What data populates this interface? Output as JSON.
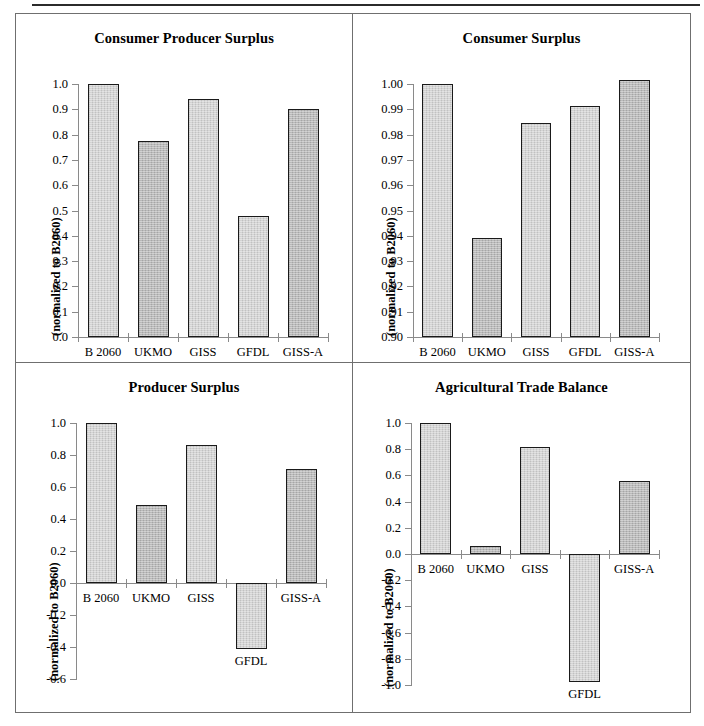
{
  "figure": {
    "panel_count": 4,
    "categories": [
      "B 2060",
      "UKMO",
      "GISS",
      "GFDL",
      "GISS-A"
    ],
    "ylabel": "(normalized to B2060)"
  },
  "chart_data": [
    {
      "type": "bar",
      "title": "Consumer Producer Surplus",
      "categories": [
        "B 2060",
        "UKMO",
        "GISS",
        "GFDL",
        "GISS-A"
      ],
      "values": [
        1.0,
        0.775,
        0.94,
        0.48,
        0.9
      ],
      "xlabel": "",
      "ylabel": "(normalized to B2060)",
      "ylim": [
        0.0,
        1.0
      ],
      "ytick_labels": [
        "1.0",
        "0.9",
        "0.8",
        "0.7",
        "0.6",
        "0.5",
        "0.4",
        "0.3",
        "0.2",
        "0.1",
        "0.0"
      ],
      "ytick_values": [
        1.0,
        0.9,
        0.8,
        0.7,
        0.6,
        0.5,
        0.4,
        0.3,
        0.2,
        0.1,
        0.0
      ],
      "grid": false,
      "legend": "none"
    },
    {
      "type": "bar",
      "title": "Consumer Surplus",
      "categories": [
        "B 2060",
        "UKMO",
        "GISS",
        "GFDL",
        "GISS-A"
      ],
      "values": [
        1.0,
        0.939,
        0.9845,
        0.9912,
        1.0015
      ],
      "xlabel": "",
      "ylabel": "(normalized to B2060)",
      "ylim": [
        0.9,
        1.0
      ],
      "ytick_labels": [
        "1.00",
        "0.99",
        "0.98",
        "0.97",
        "0.96",
        "0.95",
        "0.94",
        "0.93",
        "0.92",
        "0.91",
        "0.90"
      ],
      "ytick_values": [
        1.0,
        0.99,
        0.98,
        0.97,
        0.96,
        0.95,
        0.94,
        0.93,
        0.92,
        0.91,
        0.9
      ],
      "grid": false,
      "legend": "none"
    },
    {
      "type": "bar",
      "title": "Producer Surplus",
      "categories": [
        "B 2060",
        "UKMO",
        "GISS",
        "GFDL",
        "GISS-A"
      ],
      "values": [
        1.0,
        0.49,
        0.86,
        -0.41,
        0.71
      ],
      "xlabel": "",
      "ylabel": "(normalized to B2060)",
      "ylim": [
        -0.6,
        1.0
      ],
      "ytick_labels": [
        "1.0",
        "0.8",
        "0.6",
        "0.4",
        "0.2",
        "0.0",
        "-0.2",
        "-0.4",
        "-0.6"
      ],
      "ytick_values": [
        1.0,
        0.8,
        0.6,
        0.4,
        0.2,
        0.0,
        -0.2,
        -0.4,
        -0.6
      ],
      "grid": false,
      "legend": "none"
    },
    {
      "type": "bar",
      "title": "Agricultural Trade Balance",
      "categories": [
        "B 2060",
        "UKMO",
        "GISS",
        "GFDL",
        "GISS-A"
      ],
      "values": [
        1.0,
        0.06,
        0.82,
        -0.98,
        0.56
      ],
      "xlabel": "",
      "ylabel": "(normalized to B2060)",
      "ylim": [
        -1.0,
        1.0
      ],
      "ytick_labels": [
        "1.0",
        "0.8",
        "0.6",
        "0.4",
        "0.2",
        "0.0",
        "-0.2",
        "-0.4",
        "-0.6",
        "-0.8",
        "-1.0"
      ],
      "ytick_values": [
        1.0,
        0.8,
        0.6,
        0.4,
        0.2,
        0.0,
        -0.2,
        -0.4,
        -0.6,
        -0.8,
        -1.0
      ],
      "grid": false,
      "legend": "none"
    }
  ]
}
